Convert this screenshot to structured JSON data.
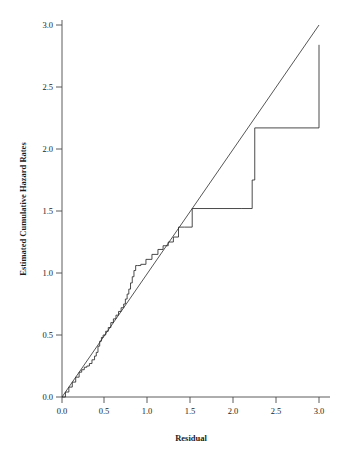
{
  "chart_data": {
    "type": "line",
    "title": "",
    "xlabel": "Residual",
    "ylabel": "Estimated Cumulative Hazard Rates",
    "xlim": [
      0.0,
      3.05
    ],
    "ylim": [
      0.0,
      3.05
    ],
    "xticks": [
      0.0,
      0.5,
      1.0,
      1.5,
      2.0,
      2.5,
      3.0
    ],
    "xticklabels": [
      "0.0",
      "0.5",
      "1.0",
      "1.5",
      "2.0",
      "2.5",
      "3.0"
    ],
    "yticks": [
      0.0,
      0.5,
      1.0,
      1.5,
      2.0,
      2.5,
      3.0
    ],
    "yticklabels": [
      "0.0",
      "0.5",
      "1.0",
      "1.5",
      "2.0",
      "2.5",
      "3.0"
    ],
    "grid": false,
    "legend": null,
    "line_color": "#2b2b2b",
    "axis_color": "#4a4a4a",
    "background": "#ffffff",
    "series": [
      {
        "name": "Reference line (y = x)",
        "type": "line",
        "style": "straight",
        "x": [
          0.0,
          3.0
        ],
        "values": [
          0.0,
          3.0
        ]
      },
      {
        "name": "Estimated cumulative hazard (step function)",
        "type": "step",
        "style": "post",
        "x": [
          0.0,
          0.04,
          0.08,
          0.12,
          0.16,
          0.2,
          0.23,
          0.26,
          0.29,
          0.32,
          0.35,
          0.38,
          0.4,
          0.42,
          0.44,
          0.46,
          0.48,
          0.51,
          0.54,
          0.57,
          0.6,
          0.63,
          0.66,
          0.69,
          0.72,
          0.74,
          0.76,
          0.78,
          0.8,
          0.82,
          0.84,
          0.86,
          0.88,
          0.92,
          0.98,
          1.05,
          1.12,
          1.18,
          1.24,
          1.3,
          1.36,
          1.43,
          1.52,
          2.1,
          2.22,
          2.25,
          3.0
        ],
        "values": [
          0.0,
          0.04,
          0.08,
          0.12,
          0.16,
          0.2,
          0.22,
          0.24,
          0.25,
          0.27,
          0.3,
          0.33,
          0.36,
          0.41,
          0.45,
          0.48,
          0.5,
          0.53,
          0.56,
          0.6,
          0.63,
          0.66,
          0.69,
          0.72,
          0.75,
          0.79,
          0.83,
          0.87,
          0.92,
          0.97,
          1.02,
          1.06,
          1.06,
          1.07,
          1.11,
          1.15,
          1.19,
          1.22,
          1.25,
          1.29,
          1.37,
          1.37,
          1.52,
          1.52,
          1.75,
          2.17,
          2.84
        ]
      }
    ],
    "annotations": {
      "plateau_long": {
        "y": 1.52,
        "x_from": 1.52,
        "x_to": 2.1
      },
      "plateau_top": {
        "y": 2.84,
        "x_from": 2.25,
        "x_to": 3.0
      }
    }
  }
}
